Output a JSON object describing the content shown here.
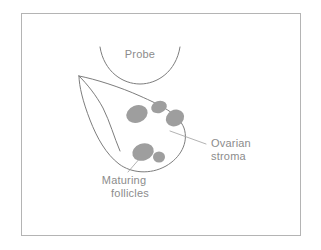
{
  "figure": {
    "background_color": "#ffffff",
    "frame": {
      "stroke_color": "#b4b4b4",
      "x": 21,
      "y": 13,
      "width": 279,
      "height": 222
    },
    "line_color": "#7d7d7d",
    "follicle_color": "#9e9e9e",
    "label_color": "#8c8c8c",
    "leader_color": "#a0a0a0"
  },
  "labels": {
    "probe": "Probe",
    "ovarian_stroma_line1": "Ovarian",
    "ovarian_stroma_line2": "stroma",
    "maturing_follicles_line1": "Maturing",
    "maturing_follicles_line2": "follicles"
  },
  "shapes": {
    "probe_arc": {
      "name": "probe-arc",
      "path": "M 100 47 C 104 72, 123 84, 140 84 C 157 84, 176 72, 180 47"
    },
    "ovary_outline": {
      "name": "ovary-outline",
      "path": "M 79 76 C 95 79, 120 87, 140 96 C 160 105, 178 113, 184 128 C 189 143, 180 158, 166 166 C 150 175, 131 173, 119 164 C 106 154, 97 138, 90 120 C 83 102, 79 86, 79 76 Z"
    },
    "ovary_tip_inner": {
      "name": "ovary-tip-inner-curve",
      "path": "M 79 76 C 87 84, 96 95, 103 108 C 110 122, 114 137, 120 151"
    },
    "follicles": [
      {
        "name": "follicle-upper-left",
        "cx": 137,
        "cy": 114,
        "rx": 11,
        "ry": 8.5,
        "rotation": -22
      },
      {
        "name": "follicle-upper-middle",
        "cx": 159,
        "cy": 107,
        "rx": 8,
        "ry": 6,
        "rotation": -18
      },
      {
        "name": "follicle-right",
        "cx": 175,
        "cy": 118,
        "rx": 9.5,
        "ry": 8,
        "rotation": -30
      },
      {
        "name": "follicle-lower-left",
        "cx": 143,
        "cy": 152,
        "rx": 11,
        "ry": 8.5,
        "rotation": -20
      },
      {
        "name": "follicle-lower-right",
        "cx": 159,
        "cy": 157,
        "rx": 6,
        "ry": 5.5,
        "rotation": 0
      }
    ],
    "leader_stroma": {
      "name": "leader-line-ovarian-stroma",
      "path": "M 170 131 L 206 144"
    },
    "leader_follicles": {
      "name": "leader-line-maturing-follicles",
      "path": "M 141 157 L 128 172"
    }
  },
  "label_positions": {
    "probe": {
      "x": 140,
      "y": 58
    },
    "stroma_line1": {
      "x": 211,
      "y": 147
    },
    "stroma_line2": {
      "x": 211,
      "y": 160
    },
    "follicles_line1": {
      "x": 124,
      "y": 184
    },
    "follicles_line2": {
      "x": 130,
      "y": 197
    }
  }
}
